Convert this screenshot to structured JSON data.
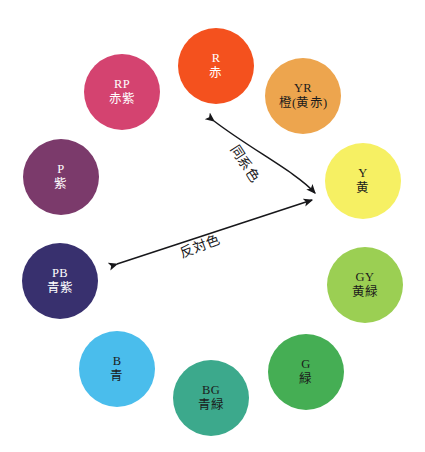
{
  "diagram": {
    "background_color": "#ffffff"
  },
  "chart_data": {
    "type": "pie",
    "xlabel": "",
    "ylabel": "",
    "legend_position": "none",
    "grid": false,
    "categories": [
      "R",
      "YR",
      "Y",
      "GY",
      "G",
      "BG",
      "B",
      "PB",
      "P",
      "RP"
    ],
    "values": [
      1,
      1,
      1,
      1,
      1,
      1,
      1,
      1,
      1,
      1
    ],
    "annotations": [
      "同系色",
      "反対色"
    ]
  },
  "swatches": [
    {
      "code": "R",
      "jp": "赤",
      "color": "#F4511E",
      "text_color": "#ffffff",
      "left": 178,
      "top": 28,
      "size": 76
    },
    {
      "code": "YR",
      "jp": "橙(黄赤)",
      "color": "#EDA54E",
      "text_color": "#1b1b1b",
      "left": 265,
      "top": 58,
      "size": 76
    },
    {
      "code": "Y",
      "jp": "黄",
      "color": "#F6F063",
      "text_color": "#1b1b1b",
      "left": 325,
      "top": 143,
      "size": 76
    },
    {
      "code": "GY",
      "jp": "黄緑",
      "color": "#9BCF53",
      "text_color": "#1b1b1b",
      "left": 327,
      "top": 247,
      "size": 76
    },
    {
      "code": "G",
      "jp": "緑",
      "color": "#45AE54",
      "text_color": "#1b1b1b",
      "left": 268,
      "top": 334,
      "size": 76
    },
    {
      "code": "BG",
      "jp": "青緑",
      "color": "#3CA98C",
      "text_color": "#1b1b1b",
      "left": 173,
      "top": 360,
      "size": 76
    },
    {
      "code": "B",
      "jp": "青",
      "color": "#4ABDEC",
      "text_color": "#1b1b1b",
      "left": 79,
      "top": 331,
      "size": 76
    },
    {
      "code": "PB",
      "jp": "青紫",
      "color": "#38306E",
      "text_color": "#ffffff",
      "left": 22,
      "top": 243,
      "size": 76
    },
    {
      "code": "P",
      "jp": "紫",
      "color": "#7B3A6B",
      "text_color": "#ffffff",
      "left": 23,
      "top": 139,
      "size": 76
    },
    {
      "code": "RP",
      "jp": "赤紫",
      "color": "#D44370",
      "text_color": "#ffffff",
      "left": 84,
      "top": 54,
      "size": 76
    }
  ],
  "arrows": {
    "analogous": {
      "label": "同系色",
      "from": "R",
      "to": "Y",
      "style": "curved",
      "heads": "both",
      "color": "#17171a"
    },
    "complementary": {
      "label": "反対色",
      "from": "PB",
      "to": "Y",
      "style": "straight",
      "heads": "both",
      "color": "#17171a"
    }
  }
}
